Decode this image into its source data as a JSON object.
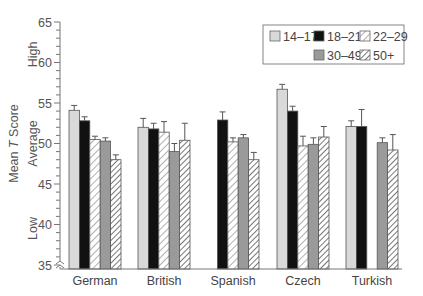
{
  "chart_data": {
    "type": "bar",
    "title": "",
    "xlabel": "",
    "ylabel": "Mean T Score",
    "ylabel_parts": [
      "Mean ",
      "T",
      " Score"
    ],
    "y_region_labels": [
      {
        "label": "High",
        "center": 61
      },
      {
        "label": "Average",
        "center": 50
      },
      {
        "label": "Low",
        "center": 39.5
      }
    ],
    "ylim": [
      35,
      65
    ],
    "yticks": [
      35,
      40,
      45,
      50,
      55,
      60,
      65
    ],
    "grid": false,
    "legend_position": "upper right",
    "categories": [
      "German",
      "British",
      "Spanish",
      "Czech",
      "Turkish"
    ],
    "series": [
      {
        "name": "14–17",
        "fill": "light-gray",
        "values": [
          54.1,
          52.0,
          null,
          56.7,
          52.1
        ],
        "errors": [
          0.6,
          1.1,
          null,
          0.6,
          0.7
        ]
      },
      {
        "name": "18–21",
        "fill": "black",
        "values": [
          52.8,
          51.8,
          52.9,
          54.0,
          52.1
        ],
        "errors": [
          0.5,
          0.7,
          1.0,
          0.6,
          2.1
        ]
      },
      {
        "name": "22–29",
        "fill": "white-hatched",
        "values": [
          50.5,
          51.4,
          50.2,
          49.7,
          null
        ],
        "errors": [
          0.4,
          1.3,
          0.5,
          1.2,
          null
        ]
      },
      {
        "name": "30–49",
        "fill": "mid-gray",
        "values": [
          50.3,
          49.0,
          50.7,
          49.9,
          50.1
        ],
        "errors": [
          0.4,
          1.0,
          0.4,
          0.8,
          0.6
        ]
      },
      {
        "name": "50+",
        "fill": "gray-hatched",
        "values": [
          48.0,
          50.4,
          48.0,
          50.8,
          49.2
        ],
        "errors": [
          0.6,
          2.1,
          0.9,
          1.3,
          1.9
        ]
      }
    ]
  },
  "legend": {
    "items": [
      "14–17",
      "18–21",
      "22–29",
      "30–49",
      "50+"
    ]
  },
  "colors": {
    "light_gray": "#d9d9d9",
    "black": "#111111",
    "mid_gray": "#9a9a9a",
    "axis": "#777777",
    "hatch": "#888888"
  }
}
